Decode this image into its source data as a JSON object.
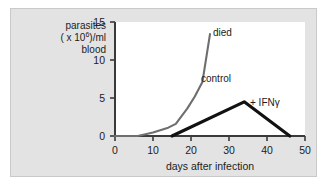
{
  "figure": {
    "panel_bg": "#e3e3e3",
    "plot_bg": "#ffffff",
    "border_color": "#c9c9c9"
  },
  "chart_data": {
    "type": "line",
    "title": "",
    "xlabel": "days after infection",
    "ylabel_lines": [
      "parasites",
      "( x 10",
      "6",
      ")/ml",
      "blood"
    ],
    "ylabel_text": "parasites ( × 10⁶)/ml blood",
    "xlim": [
      0,
      50
    ],
    "ylim": [
      0,
      15
    ],
    "xticks": [
      0,
      10,
      20,
      30,
      40,
      50
    ],
    "yticks": [
      0,
      5,
      10,
      15
    ],
    "xtick_labels": [
      "0",
      "10",
      "20",
      "30",
      "40",
      "50"
    ],
    "ytick_labels": [
      "0",
      "5",
      "10",
      "15"
    ],
    "grid": false,
    "legend_position": "inline-annotations",
    "series": [
      {
        "name": "control",
        "label": "control",
        "color": "#6e6e6e",
        "endpoint_label": "died",
        "x": [
          0,
          6,
          10,
          14,
          16,
          19,
          21,
          23,
          25
        ],
        "values": [
          0,
          0,
          0.45,
          1.1,
          1.6,
          3.6,
          5.2,
          7.1,
          13.4
        ]
      },
      {
        "name": "+ IFN gamma",
        "label": "+ IFNγ",
        "color": "#111111",
        "x": [
          15,
          34,
          46
        ],
        "values": [
          0,
          4.5,
          0
        ]
      }
    ],
    "annotations": [
      {
        "name": "died",
        "text": "died",
        "x": 26,
        "y": 14.2
      },
      {
        "name": "control",
        "text": "control",
        "x": 23.5,
        "y": 8.6
      },
      {
        "name": "ifng",
        "text": "+ IFNγ",
        "x": 35.5,
        "y": 5.6
      }
    ]
  }
}
